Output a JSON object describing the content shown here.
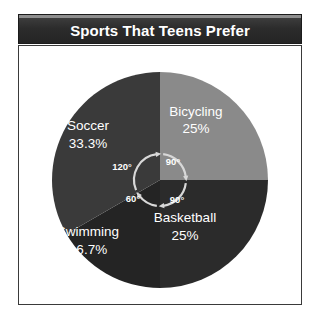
{
  "title": {
    "text": "Sports That Teens Prefer"
  },
  "colors": {
    "title_bar_bg": "#262626",
    "title_bar_highlight": "#8e8e8e",
    "title_text": "#ffffff",
    "panel_bg": "#ffffff",
    "panel_border": "#3a3a3a",
    "label_text": "#ffffff",
    "arc_stroke": "#d8d8d8"
  },
  "chart_data": {
    "type": "pie",
    "title": "Sports That Teens Prefer",
    "xlabel": "",
    "ylabel": "",
    "legend_position": "none",
    "grid": false,
    "start_angle_deg": 0,
    "direction": "clockwise",
    "center": {
      "x": 160,
      "y": 180
    },
    "radius": 108,
    "categories": [
      "Bicycling",
      "Basketball",
      "Swimming",
      "Soccer"
    ],
    "values": [
      25,
      25,
      16.7,
      33.3
    ],
    "angles_deg": [
      90,
      90,
      60,
      120
    ],
    "slices": [
      {
        "name": "Bicycling",
        "percent_label": "25%",
        "value": 25,
        "angle_deg": 90,
        "angle_label": "90°",
        "color": "#8a8a8a",
        "label_x": 196,
        "label_y": 116,
        "percent_x": 196,
        "percent_y": 133,
        "angle_label_x": 173,
        "angle_label_y": 165
      },
      {
        "name": "Basketball",
        "percent_label": "25%",
        "value": 25,
        "angle_deg": 90,
        "angle_label": "90°",
        "color": "#2b2b2b",
        "label_x": 185,
        "label_y": 222,
        "percent_x": 185,
        "percent_y": 240,
        "angle_label_x": 177,
        "angle_label_y": 203
      },
      {
        "name": "Swimming",
        "percent_label": "16.7%",
        "value": 16.7,
        "angle_deg": 60,
        "angle_label": "60°",
        "color": "#242424",
        "label_x": 88,
        "label_y": 236,
        "percent_x": 88,
        "percent_y": 254,
        "angle_label_x": 133,
        "angle_label_y": 202
      },
      {
        "name": "Soccer",
        "percent_label": "33.3%",
        "value": 33.3,
        "angle_deg": 120,
        "angle_label": "120°",
        "color": "#3a3a3a",
        "label_x": 88,
        "label_y": 130,
        "percent_x": 88,
        "percent_y": 148,
        "angle_label_x": 122,
        "angle_label_y": 170
      }
    ]
  }
}
